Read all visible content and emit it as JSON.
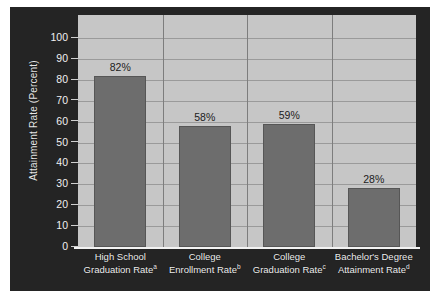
{
  "chart_data": {
    "type": "bar",
    "title": "",
    "xlabel": "",
    "ylabel": "Attainment Rate (Percent)",
    "ylim": [
      0,
      100
    ],
    "ytick_step": 10,
    "yticks": [
      100,
      90,
      80,
      70,
      60,
      50,
      40,
      30,
      20,
      10,
      0
    ],
    "grid": true,
    "legend": false,
    "categories": [
      "High School Graduation Rate",
      "College Enrollment Rate",
      "College Graduation Rate",
      "Bachelor's Degree Attainment Rate"
    ],
    "category_lines": [
      [
        "High School",
        "Graduation Rate"
      ],
      [
        "College",
        "Enrollment Rate"
      ],
      [
        "College",
        "Graduation Rate"
      ],
      [
        "Bachelor's Degree",
        "Attainment Rate"
      ]
    ],
    "footnote_markers": [
      "a",
      "b",
      "c",
      "d"
    ],
    "values": [
      82,
      58,
      59,
      28
    ],
    "value_labels": [
      "82%",
      "58%",
      "59%",
      "28%"
    ],
    "colors": {
      "bar": "#6d6d6d",
      "bar_border": "#565656",
      "plot_background": "#c6c6c6",
      "panel_background": "#242424",
      "gridline": "#9a9a9a",
      "axis_text": "#f0f0f0",
      "value_text": "#1c1c1c"
    }
  }
}
